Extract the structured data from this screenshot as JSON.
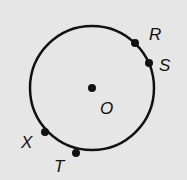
{
  "diagram": {
    "background": "#e6e6e6",
    "stroke": "#111111",
    "circle": {
      "cx": 92,
      "cy": 88,
      "r": 62
    },
    "center": {
      "label": "O",
      "x": 92,
      "y": 88,
      "label_x": 100,
      "label_y": 114
    },
    "points": [
      {
        "label": "R",
        "x": 135,
        "y": 43,
        "label_x": 149,
        "label_y": 40
      },
      {
        "label": "S",
        "x": 149,
        "y": 63,
        "label_x": 159,
        "label_y": 71
      },
      {
        "label": "X",
        "x": 45,
        "y": 132,
        "label_x": 21,
        "label_y": 148
      },
      {
        "label": "T",
        "x": 76,
        "y": 153,
        "label_x": 54,
        "label_y": 172
      }
    ]
  }
}
